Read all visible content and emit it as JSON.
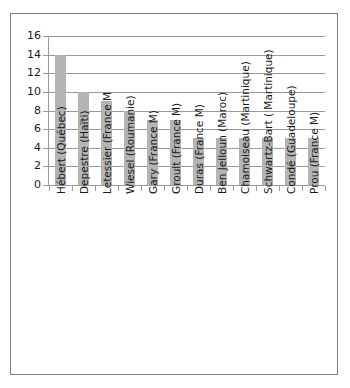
{
  "chart_data": {
    "type": "bar",
    "title": "",
    "subtitle": "",
    "xlabel": "",
    "ylabel": "",
    "ylim": [
      0,
      16
    ],
    "ytick_step": 2,
    "yticks": [
      0,
      2,
      4,
      6,
      8,
      10,
      12,
      14,
      16
    ],
    "grid": true,
    "legend": false,
    "legend_position": "none",
    "orientation": "vertical",
    "bar_color": "#b4b4b4",
    "gridline_color": "#9a9a9a",
    "axis_color": "#9a9a9a",
    "border_color": "#808080",
    "background_color": "#ffffff",
    "text_color": "#1a1a1a",
    "xtick_label_rotation": -90,
    "categories": [
      "Hébert (Québec)",
      "Depestre (Haïti)",
      "Letessier (France M",
      "Wiesel (Roumanie)",
      "Gary (France M)",
      "Groult (France M)",
      "Duras (France M)",
      "Ben Jelloun (Maroc)",
      "Chamoiseau (Martinique)",
      "Schwartz-Bart ( Martinique)",
      "Condé (Guadeloupe)",
      "Prou (France M)"
    ],
    "values": [
      14,
      10,
      9,
      8,
      7,
      7,
      5,
      5,
      5,
      5,
      5,
      5
    ]
  }
}
